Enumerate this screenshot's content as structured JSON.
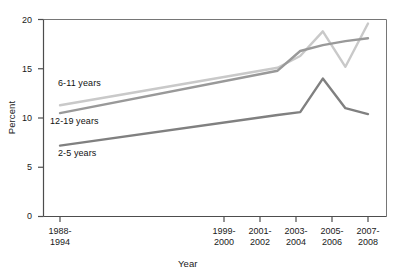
{
  "chart_data": {
    "type": "line",
    "title": "",
    "xlabel": "Year",
    "ylabel": "Percent",
    "ylim": [
      0,
      20
    ],
    "yticks": [
      0,
      5,
      10,
      15,
      20
    ],
    "ytick_labels": [
      "0",
      "5",
      "10",
      "15",
      "20"
    ],
    "grid": false,
    "legend_position": "inline-labels",
    "categories": [
      "1988-1994",
      "1999-2000",
      "2001-2002",
      "2003-2004",
      "2005-2006",
      "2007-2008"
    ],
    "category_lines": [
      [
        "1988-",
        "1994"
      ],
      [
        "1999-",
        "2000"
      ],
      [
        "2001-",
        "2002"
      ],
      [
        "2003-",
        "2004"
      ],
      [
        "2005-",
        "2006"
      ],
      [
        "2007-",
        "2008"
      ]
    ],
    "x_positions_fraction": [
      0.0,
      0.655,
      0.723,
      0.791,
      0.859,
      0.927
    ],
    "series": [
      {
        "name": "6-11 years",
        "color": "#c9c9c9",
        "values": [
          11.3,
          15.1,
          16.3,
          18.8,
          15.2,
          19.6
        ]
      },
      {
        "name": "12-19 years",
        "color": "#999999",
        "values": [
          10.5,
          14.8,
          16.8,
          17.4,
          17.8,
          18.1
        ]
      },
      {
        "name": "2-5 years",
        "color": "#808080",
        "values": [
          7.2,
          10.3,
          10.6,
          14.0,
          11.0,
          10.4
        ]
      }
    ],
    "inline_labels": [
      {
        "text": "6-11 years",
        "x": 58,
        "y": 78
      },
      {
        "text": "12-19 years",
        "x": 50,
        "y": 116
      },
      {
        "text": "2-5 years",
        "x": 58,
        "y": 148
      }
    ]
  },
  "axes": {
    "y_title": "Percent",
    "x_title": "Year"
  }
}
